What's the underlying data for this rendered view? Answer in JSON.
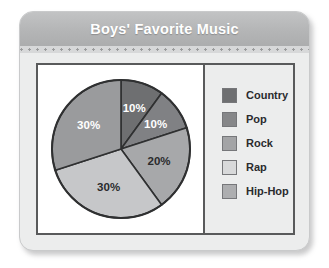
{
  "card": {
    "title": "Boys' Favorite Music"
  },
  "chart_data": {
    "type": "pie",
    "title": "Boys' Favorite Music",
    "xlabel": "",
    "ylabel": "",
    "legend_position": "right",
    "grid": false,
    "categories": [
      "Country",
      "Pop",
      "Rock",
      "Rap",
      "Hip-Hop"
    ],
    "values": [
      10,
      10,
      20,
      30,
      30
    ],
    "unit": "%",
    "start_angle_deg": 0,
    "direction": "clockwise",
    "slices": [
      {
        "name": "Country",
        "value": 10,
        "label": "10%",
        "color": "#6e6f71",
        "label_color": "#ffffff",
        "start_deg": 0,
        "end_deg": 36
      },
      {
        "name": "Pop",
        "value": 10,
        "label": "10%",
        "color": "#808184",
        "label_color": "#ffffff",
        "start_deg": 36,
        "end_deg": 72
      },
      {
        "name": "Rock",
        "value": 20,
        "label": "20%",
        "color": "#a7a8aa",
        "label_color": "#2a2b2d",
        "start_deg": 90,
        "end_deg": 162
      },
      {
        "name": "Rap",
        "value": 30,
        "label": "30%",
        "color": "#c6c7c9",
        "label_color": "#2a2b2d",
        "start_deg": 162,
        "end_deg": 270
      },
      {
        "name": "Hip-Hop",
        "value": 30,
        "label": "30%",
        "color": "#9a9b9d",
        "label_color": "#ffffff",
        "start_deg": 270,
        "end_deg": 360
      }
    ]
  },
  "legend": {
    "items": [
      {
        "label": "Country",
        "color": "#6e6f71"
      },
      {
        "label": "Pop",
        "color": "#868789"
      },
      {
        "label": "Rock",
        "color": "#a3a4a6"
      },
      {
        "label": "Rap",
        "color": "#d8d9da"
      },
      {
        "label": "Hip-Hop",
        "color": "#adaeb0"
      }
    ]
  }
}
